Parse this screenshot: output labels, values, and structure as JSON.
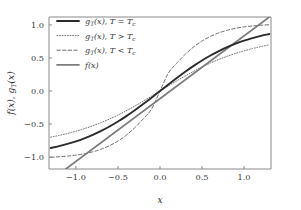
{
  "chart_data": {
    "type": "line",
    "title": "",
    "xlabel": "x",
    "ylabel": "f(x), g_T(x)",
    "xlim": [
      -1.32,
      1.32
    ],
    "ylim": [
      -1.18,
      1.12
    ],
    "xticks": [
      -1.0,
      -0.5,
      0.0,
      0.5,
      1.0
    ],
    "xticklabels": [
      "-1.0",
      "-0.5",
      "0.0",
      "0.5",
      "1.0"
    ],
    "yticks": [
      -1.0,
      -0.5,
      0.0,
      0.5,
      1.0
    ],
    "yticklabels": [
      "-1.0",
      "-0.5",
      "0.0",
      "0.5",
      "1.0"
    ],
    "grid": false,
    "legend_position": "upper left",
    "series": [
      {
        "name": "g_T(x), T = T_c",
        "label_parts": {
          "fn": "g",
          "sub": "T",
          "arg": "(x)",
          "cond": "T = T"
        },
        "style": "solid",
        "width": 1.9,
        "color": "#2b2b2b",
        "x": [
          -1.3,
          -1.2,
          -1.1,
          -1.0,
          -0.9,
          -0.8,
          -0.7,
          -0.6,
          -0.5,
          -0.4,
          -0.3,
          -0.2,
          -0.1,
          0.0,
          0.1,
          0.2,
          0.3,
          0.4,
          0.5,
          0.6,
          0.7,
          0.8,
          0.9,
          1.0,
          1.1,
          1.2,
          1.3
        ],
        "y": [
          -0.862,
          -0.834,
          -0.8,
          -0.762,
          -0.716,
          -0.664,
          -0.604,
          -0.537,
          -0.462,
          -0.38,
          -0.291,
          -0.197,
          -0.1,
          0.0,
          0.1,
          0.197,
          0.291,
          0.38,
          0.462,
          0.537,
          0.604,
          0.664,
          0.716,
          0.762,
          0.8,
          0.834,
          0.862
        ]
      },
      {
        "name": "g_T(x), T > T_c",
        "label_parts": {
          "fn": "g",
          "sub": "T",
          "arg": "(x)",
          "cond": "T > T"
        },
        "style": "dotted",
        "width": 1.0,
        "color": "#6e6e6e",
        "x": [
          -1.3,
          -1.2,
          -1.1,
          -1.0,
          -0.9,
          -0.8,
          -0.7,
          -0.6,
          -0.5,
          -0.4,
          -0.3,
          -0.2,
          -0.1,
          0.0,
          0.1,
          0.2,
          0.3,
          0.4,
          0.5,
          0.6,
          0.7,
          0.8,
          0.9,
          1.0,
          1.1,
          1.2,
          1.3
        ],
        "y": [
          -0.698,
          -0.672,
          -0.642,
          -0.608,
          -0.57,
          -0.526,
          -0.478,
          -0.424,
          -0.364,
          -0.298,
          -0.228,
          -0.154,
          -0.078,
          0.0,
          0.078,
          0.154,
          0.228,
          0.298,
          0.364,
          0.424,
          0.478,
          0.526,
          0.57,
          0.608,
          0.642,
          0.672,
          0.698
        ]
      },
      {
        "name": "g_T(x), T < T_c",
        "label_parts": {
          "fn": "g",
          "sub": "T",
          "arg": "(x)",
          "cond": "T < T"
        },
        "style": "dashed",
        "width": 1.0,
        "color": "#6e6e6e",
        "x": [
          -1.3,
          -1.2,
          -1.1,
          -1.0,
          -0.9,
          -0.8,
          -0.7,
          -0.6,
          -0.5,
          -0.4,
          -0.3,
          -0.2,
          -0.1,
          0.0,
          0.1,
          0.2,
          0.3,
          0.4,
          0.5,
          0.6,
          0.7,
          0.8,
          0.9,
          1.0,
          1.1,
          1.2,
          1.3
        ],
        "y": [
          -1.003,
          -0.995,
          -0.985,
          -0.97,
          -0.949,
          -0.92,
          -0.88,
          -0.827,
          -0.757,
          -0.667,
          -0.555,
          -0.422,
          -0.271,
          0.0,
          0.271,
          0.422,
          0.555,
          0.667,
          0.757,
          0.827,
          0.88,
          0.92,
          0.949,
          0.97,
          0.985,
          0.995,
          1.003
        ]
      },
      {
        "name": "f(x)",
        "label_parts": {
          "fn": "f",
          "sub": "",
          "arg": "(x)",
          "cond": ""
        },
        "style": "solid",
        "width": 1.7,
        "color": "#7d7d7d",
        "x": [
          -1.12,
          1.3
        ],
        "y": [
          -1.18,
          1.12
        ],
        "slope": 0.95,
        "intercept": 0.0
      }
    ],
    "subscript_c": "c",
    "colors": {
      "critical": "#2b2b2b",
      "above_tc": "#6e6e6e",
      "below_tc": "#6e6e6e",
      "identity": "#7d7d7d",
      "axis": "#8a8a8a",
      "text": "#3a3a3a",
      "background": "#ffffff"
    }
  }
}
